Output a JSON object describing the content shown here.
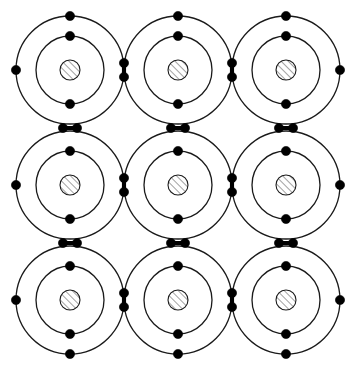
{
  "figure": {
    "width": 357,
    "height": 373,
    "background_color": "#ffffff",
    "line_color": "#1a1a1a",
    "electron_color": "#000000",
    "nucleus_hatch_color": "#555555"
  },
  "chart_data": {
    "type": "diagram",
    "grid": {
      "columns": 3,
      "rows": 3,
      "column_centers_x": [
        70,
        178,
        286
      ],
      "row_centers_y": [
        70,
        185,
        300
      ]
    },
    "atom": {
      "outer_shell_radius": 54,
      "inner_shell_radius": 34,
      "nucleus_radius": 10,
      "shell_stroke_width": 1.3,
      "electron_radius": 4.6
    },
    "atoms": [
      {
        "id": "atom-r1c1",
        "row": 1,
        "col": 1,
        "cx": 70,
        "cy": 70
      },
      {
        "id": "atom-r1c2",
        "row": 1,
        "col": 2,
        "cx": 178,
        "cy": 70
      },
      {
        "id": "atom-r1c3",
        "row": 1,
        "col": 3,
        "cx": 286,
        "cy": 70
      },
      {
        "id": "atom-r2c1",
        "row": 2,
        "col": 1,
        "cx": 70,
        "cy": 185
      },
      {
        "id": "atom-r2c2",
        "row": 2,
        "col": 2,
        "cx": 178,
        "cy": 185
      },
      {
        "id": "atom-r2c3",
        "row": 2,
        "col": 3,
        "cx": 286,
        "cy": 185
      },
      {
        "id": "atom-r3c1",
        "row": 3,
        "col": 1,
        "cx": 70,
        "cy": 300
      },
      {
        "id": "atom-r3c2",
        "row": 3,
        "col": 2,
        "cx": 178,
        "cy": 300
      },
      {
        "id": "atom-r3c3",
        "row": 3,
        "col": 3,
        "cx": 286,
        "cy": 300
      }
    ],
    "inner_shell_electrons": [
      {
        "atom": "atom-r1c1",
        "x": 70,
        "y": 36
      },
      {
        "atom": "atom-r1c1",
        "x": 70,
        "y": 104
      },
      {
        "atom": "atom-r1c2",
        "x": 178,
        "y": 36
      },
      {
        "atom": "atom-r1c2",
        "x": 178,
        "y": 104
      },
      {
        "atom": "atom-r1c3",
        "x": 286,
        "y": 36
      },
      {
        "atom": "atom-r1c3",
        "x": 286,
        "y": 104
      },
      {
        "atom": "atom-r2c1",
        "x": 70,
        "y": 151
      },
      {
        "atom": "atom-r2c1",
        "x": 70,
        "y": 219
      },
      {
        "atom": "atom-r2c2",
        "x": 178,
        "y": 151
      },
      {
        "atom": "atom-r2c2",
        "x": 178,
        "y": 219
      },
      {
        "atom": "atom-r2c3",
        "x": 286,
        "y": 151
      },
      {
        "atom": "atom-r2c3",
        "x": 286,
        "y": 219
      },
      {
        "atom": "atom-r3c1",
        "x": 70,
        "y": 266
      },
      {
        "atom": "atom-r3c1",
        "x": 70,
        "y": 334
      },
      {
        "atom": "atom-r3c2",
        "x": 178,
        "y": 266
      },
      {
        "atom": "atom-r3c2",
        "x": 178,
        "y": 334
      },
      {
        "atom": "atom-r3c3",
        "x": 286,
        "y": 266
      },
      {
        "atom": "atom-r3c3",
        "x": 286,
        "y": 334
      }
    ],
    "outer_shell_lone_electrons": [
      {
        "label": "top-r1c1",
        "x": 70,
        "y": 16
      },
      {
        "label": "top-r1c2",
        "x": 178,
        "y": 16
      },
      {
        "label": "top-r1c3",
        "x": 286,
        "y": 16
      },
      {
        "label": "bottom-r3c1",
        "x": 70,
        "y": 354
      },
      {
        "label": "bottom-r3c2",
        "x": 178,
        "y": 354
      },
      {
        "label": "bottom-r3c3",
        "x": 286,
        "y": 354
      },
      {
        "label": "left-r1c1",
        "x": 16,
        "y": 70
      },
      {
        "label": "left-r2c1",
        "x": 16,
        "y": 185
      },
      {
        "label": "left-r3c1",
        "x": 16,
        "y": 300
      },
      {
        "label": "right-r1c3",
        "x": 340,
        "y": 70
      },
      {
        "label": "right-r2c3",
        "x": 340,
        "y": 185
      },
      {
        "label": "right-r3c3",
        "x": 340,
        "y": 300
      }
    ],
    "shared_electron_pairs": [
      {
        "label": "bond-r1c1-r1c2",
        "orientation": "vertical",
        "x": 124,
        "y": 70,
        "e1": {
          "x": 124,
          "y": 63
        },
        "e2": {
          "x": 124,
          "y": 77
        }
      },
      {
        "label": "bond-r1c2-r1c3",
        "orientation": "vertical",
        "x": 232,
        "y": 70,
        "e1": {
          "x": 232,
          "y": 63
        },
        "e2": {
          "x": 232,
          "y": 77
        }
      },
      {
        "label": "bond-r2c1-r2c2",
        "orientation": "vertical",
        "x": 124,
        "y": 185,
        "e1": {
          "x": 124,
          "y": 178
        },
        "e2": {
          "x": 124,
          "y": 192
        }
      },
      {
        "label": "bond-r2c2-r2c3",
        "orientation": "vertical",
        "x": 232,
        "y": 185,
        "e1": {
          "x": 232,
          "y": 178
        },
        "e2": {
          "x": 232,
          "y": 192
        }
      },
      {
        "label": "bond-r3c1-r3c2",
        "orientation": "vertical",
        "x": 124,
        "y": 300,
        "e1": {
          "x": 124,
          "y": 293
        },
        "e2": {
          "x": 124,
          "y": 307
        }
      },
      {
        "label": "bond-r3c2-r3c3",
        "orientation": "vertical",
        "x": 232,
        "y": 300,
        "e1": {
          "x": 232,
          "y": 293
        },
        "e2": {
          "x": 232,
          "y": 307
        }
      },
      {
        "label": "bond-r1c1-r2c1",
        "orientation": "horizontal",
        "x": 70,
        "y": 128,
        "e1": {
          "x": 63,
          "y": 128
        },
        "e2": {
          "x": 77,
          "y": 128
        }
      },
      {
        "label": "bond-r1c2-r2c2",
        "orientation": "horizontal",
        "x": 178,
        "y": 128,
        "e1": {
          "x": 171,
          "y": 128
        },
        "e2": {
          "x": 185,
          "y": 128
        }
      },
      {
        "label": "bond-r1c3-r2c3",
        "orientation": "horizontal",
        "x": 286,
        "y": 128,
        "e1": {
          "x": 279,
          "y": 128
        },
        "e2": {
          "x": 293,
          "y": 128
        }
      },
      {
        "label": "bond-r2c1-r3c1",
        "orientation": "horizontal",
        "x": 70,
        "y": 243,
        "e1": {
          "x": 63,
          "y": 243
        },
        "e2": {
          "x": 77,
          "y": 243
        }
      },
      {
        "label": "bond-r2c2-r3c2",
        "orientation": "horizontal",
        "x": 178,
        "y": 243,
        "e1": {
          "x": 171,
          "y": 243
        },
        "e2": {
          "x": 185,
          "y": 243
        }
      },
      {
        "label": "bond-r2c3-r3c3",
        "orientation": "horizontal",
        "x": 286,
        "y": 243,
        "e1": {
          "x": 279,
          "y": 243
        },
        "e2": {
          "x": 293,
          "y": 243
        }
      }
    ]
  }
}
